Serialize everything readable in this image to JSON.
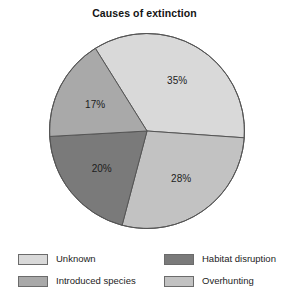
{
  "chart_data": {
    "type": "pie",
    "title": "Causes of extinction",
    "xlabel": "",
    "ylabel": "",
    "legend_position": "bottom",
    "grid": false,
    "categories": [
      "Unknown",
      "Overhunting",
      "Habitat disruption",
      "Introduced species"
    ],
    "values": [
      35,
      28,
      20,
      17
    ],
    "value_unit": "%",
    "slices": [
      {
        "label": "Unknown",
        "value": 35,
        "value_label": "35%",
        "color": "#d9d9d9"
      },
      {
        "label": "Overhunting",
        "value": 28,
        "value_label": "28%",
        "color": "#c2c2c2"
      },
      {
        "label": "Habitat disruption",
        "value": 20,
        "value_label": "20%",
        "color": "#7a7a7a"
      },
      {
        "label": "Introduced species",
        "value": 17,
        "value_label": "17%",
        "color": "#a9a9a9"
      }
    ]
  },
  "legend": {
    "items": [
      {
        "label": "Unknown",
        "color": "#d9d9d9"
      },
      {
        "label": "Habitat disruption",
        "color": "#7a7a7a"
      },
      {
        "label": "Introduced species",
        "color": "#a9a9a9"
      },
      {
        "label": "Overhunting",
        "color": "#c2c2c2"
      }
    ]
  },
  "colors": {
    "background": "#ffffff",
    "outline": "#555555",
    "text": "#1c1c1c"
  }
}
